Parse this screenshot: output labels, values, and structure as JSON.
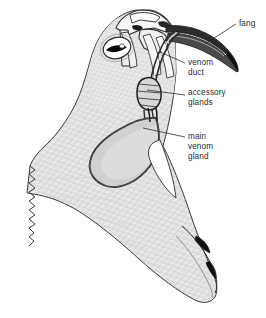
{
  "figure": {
    "background_color": "#ffffff",
    "ink_color": "#2b2b2b",
    "scale_fill": "#e4e4e4",
    "gland_fill": "#d2d2d2",
    "bone_fill": "#f2f2f2",
    "black_fill": "#101010"
  },
  "labels": [
    {
      "id": "fang",
      "text": "fang",
      "x": 239,
      "y": 25,
      "lines": [
        "fang"
      ]
    },
    {
      "id": "venom-duct",
      "text": "venom duct",
      "x": 188,
      "y": 66,
      "lines": [
        "venom",
        "duct"
      ]
    },
    {
      "id": "accessory-glands",
      "text": "accessory glands",
      "x": 188,
      "y": 96,
      "lines": [
        "accessory",
        "glands"
      ]
    },
    {
      "id": "main-venom-gland",
      "text": "main venom gland",
      "x": 188,
      "y": 139,
      "lines": [
        "main",
        "venom",
        "gland"
      ]
    }
  ],
  "anatomy_parts": [
    {
      "id": "head-body",
      "name": "head and neck with scales"
    },
    {
      "id": "eye",
      "name": "eye with vertical pupil"
    },
    {
      "id": "skull-bones",
      "name": "upper jaw bones"
    },
    {
      "id": "fang-shape",
      "name": "fang"
    },
    {
      "id": "venom-duct-shape",
      "name": "venom duct"
    },
    {
      "id": "accessory-gland-shape",
      "name": "accessory glands"
    },
    {
      "id": "main-venom-gland-shape",
      "name": "main venom gland"
    },
    {
      "id": "lower-jaw",
      "name": "lower jaw"
    },
    {
      "id": "cut-edge",
      "name": "wavy cut edge of neck"
    }
  ]
}
